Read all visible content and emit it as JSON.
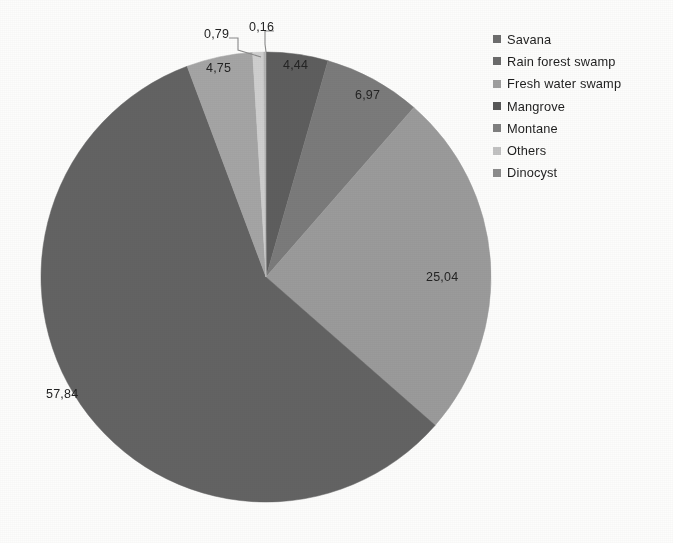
{
  "chart_data": {
    "type": "pie",
    "title": "",
    "labels": [
      "Savana",
      "Rain forest swamp",
      "Fresh water swamp",
      "Mangrove",
      "Montane",
      "Others",
      "Dinocyst"
    ],
    "values": [
      57.84,
      4.44,
      25.04,
      6.97,
      4.75,
      0.79,
      0.16
    ],
    "value_labels": [
      "57,84",
      "4,44",
      "25,04",
      "6,97",
      "4,75",
      "0,79",
      "0,16"
    ],
    "decimal_separator": ",",
    "units": "%",
    "legend_position": "right",
    "grid": false,
    "start_angle_deg": 0,
    "direction": "clockwise",
    "slice_colors": [
      "#636363",
      "#5e5e5e",
      "#9b9b9b",
      "#7b7b7b",
      "#a5a5a5",
      "#cfcfcf",
      "#b4b4b4"
    ],
    "draw_order": [
      "Rain forest swamp",
      "Mangrove",
      "Fresh water swamp",
      "Savana",
      "Montane",
      "Others",
      "Dinocyst"
    ],
    "leader_line_labels": [
      "0,79",
      "0,16"
    ]
  },
  "pie": {
    "labels": [
      {
        "text": "4,44",
        "x": 283,
        "y": 58
      },
      {
        "text": "6,97",
        "x": 355,
        "y": 88
      },
      {
        "text": "25,04",
        "x": 426,
        "y": 270
      },
      {
        "text": "57,84",
        "x": 46,
        "y": 387
      },
      {
        "text": "4,75",
        "x": 206,
        "y": 61
      },
      {
        "text": "0,79",
        "x": 204,
        "y": 27
      },
      {
        "text": "0,16",
        "x": 249,
        "y": 20
      }
    ]
  },
  "legend": {
    "items": [
      {
        "label": "Savana",
        "color": "#6e6e6e"
      },
      {
        "label": "Rain forest swamp",
        "color": "#6b6b6b"
      },
      {
        "label": "Fresh water swamp",
        "color": "#9f9f9f"
      },
      {
        "label": "Mangrove",
        "color": "#575757"
      },
      {
        "label": "Montane",
        "color": "#808080"
      },
      {
        "label": "Others",
        "color": "#c2c2c2"
      },
      {
        "label": "Dinocyst",
        "color": "#8c8c8c"
      }
    ]
  }
}
